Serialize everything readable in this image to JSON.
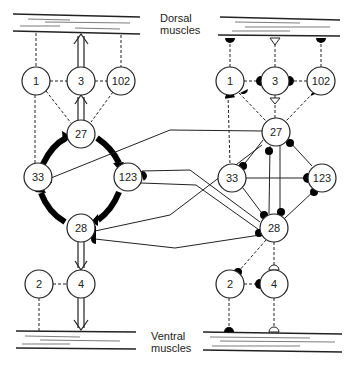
{
  "labels": {
    "dorsal_line1": "Dorsal",
    "dorsal_line2": "muscles",
    "ventral_line1": "Ventral",
    "ventral_line2": "muscles"
  },
  "left_network": {
    "nodes": [
      {
        "id": "1",
        "label": "1"
      },
      {
        "id": "3",
        "label": "3"
      },
      {
        "id": "102",
        "label": "102"
      },
      {
        "id": "27",
        "label": "27"
      },
      {
        "id": "33",
        "label": "33"
      },
      {
        "id": "123",
        "label": "123"
      },
      {
        "id": "28",
        "label": "28"
      },
      {
        "id": "2",
        "label": "2"
      },
      {
        "id": "4",
        "label": "4"
      }
    ]
  },
  "right_network": {
    "nodes": [
      {
        "id": "1",
        "label": "1"
      },
      {
        "id": "3",
        "label": "3"
      },
      {
        "id": "102",
        "label": "102"
      },
      {
        "id": "27",
        "label": "27"
      },
      {
        "id": "33",
        "label": "33"
      },
      {
        "id": "123",
        "label": "123"
      },
      {
        "id": "28",
        "label": "28"
      },
      {
        "id": "2",
        "label": "2"
      },
      {
        "id": "4",
        "label": "4"
      }
    ]
  }
}
